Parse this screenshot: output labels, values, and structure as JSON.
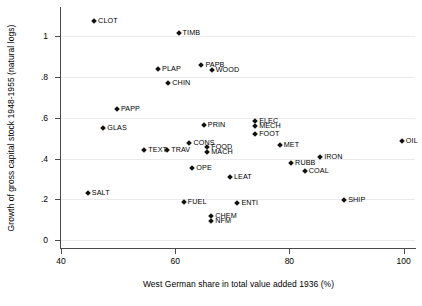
{
  "chart_data": {
    "type": "scatter",
    "title": "",
    "xlabel": "West German share in total value added 1936 (%)",
    "ylabel": "Growth of gross capital stock 1948-1955 (natural logs)",
    "xlim": [
      40,
      102
    ],
    "ylim": [
      -0.04,
      1.14
    ],
    "xticks": [
      40,
      60,
      80,
      100
    ],
    "xtick_labels": [
      "40",
      "60",
      "80",
      "100"
    ],
    "yticks": [
      0,
      0.2,
      0.4,
      0.6,
      0.8,
      1.0
    ],
    "ytick_labels": [
      "0",
      ".2",
      ".4",
      ".6",
      ".8",
      "1"
    ],
    "grid": "horizontal",
    "legend": "none",
    "marker": "diamond",
    "marker_color": "#111111",
    "grid_color": "#e9e9ee",
    "axis_color": "#4a4a4a",
    "points": [
      {
        "label": "CLOT",
        "x": 45.8,
        "y": 1.075
      },
      {
        "label": "TIMB",
        "x": 60.6,
        "y": 1.015
      },
      {
        "label": "PAPB",
        "x": 64.6,
        "y": 0.862
      },
      {
        "label": "PLAP",
        "x": 57.0,
        "y": 0.838
      },
      {
        "label": "WOOD",
        "x": 66.4,
        "y": 0.833
      },
      {
        "label": "CHIN",
        "x": 58.8,
        "y": 0.772
      },
      {
        "label": "PAPP",
        "x": 49.8,
        "y": 0.645
      },
      {
        "label": "ELEC",
        "x": 74.0,
        "y": 0.585
      },
      {
        "label": "PRIN",
        "x": 65.0,
        "y": 0.565
      },
      {
        "label": "MECH",
        "x": 74.0,
        "y": 0.558
      },
      {
        "label": "GLAS",
        "x": 47.4,
        "y": 0.552
      },
      {
        "label": "FOOT",
        "x": 74.0,
        "y": 0.522
      },
      {
        "label": "CONS",
        "x": 62.5,
        "y": 0.478
      },
      {
        "label": "OIL",
        "x": 99.7,
        "y": 0.487
      },
      {
        "label": "MET",
        "x": 78.3,
        "y": 0.468
      },
      {
        "label": "FOOD",
        "x": 65.6,
        "y": 0.455
      },
      {
        "label": "TEXT",
        "x": 54.6,
        "y": 0.443
      },
      {
        "label": "TRAV",
        "x": 58.6,
        "y": 0.443
      },
      {
        "label": "MACH",
        "x": 65.6,
        "y": 0.432
      },
      {
        "label": "IRON",
        "x": 85.4,
        "y": 0.408
      },
      {
        "label": "RUBB",
        "x": 80.3,
        "y": 0.378
      },
      {
        "label": "OPE",
        "x": 63.0,
        "y": 0.352
      },
      {
        "label": "COAL",
        "x": 82.7,
        "y": 0.338
      },
      {
        "label": "LEAT",
        "x": 69.6,
        "y": 0.308
      },
      {
        "label": "SALT",
        "x": 44.7,
        "y": 0.232
      },
      {
        "label": "SHIP",
        "x": 89.6,
        "y": 0.195
      },
      {
        "label": "FUEL",
        "x": 61.5,
        "y": 0.185
      },
      {
        "label": "ENTI",
        "x": 70.9,
        "y": 0.182
      },
      {
        "label": "CHEM",
        "x": 66.3,
        "y": 0.118
      },
      {
        "label": "NFM",
        "x": 66.3,
        "y": 0.092
      }
    ]
  }
}
